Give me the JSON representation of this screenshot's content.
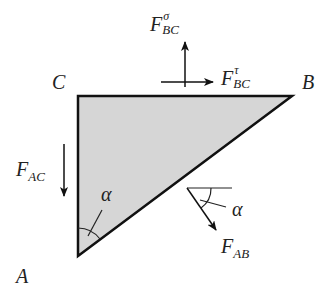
{
  "diagram": {
    "title_fragment": "",
    "vertices": {
      "A": "A",
      "B": "B",
      "C": "C"
    },
    "forces": {
      "F_BC_sigma": {
        "base": "F",
        "sup": "σ",
        "sub": "BC"
      },
      "F_BC_tau": {
        "base": "F",
        "sup": "τ",
        "sub": "BC"
      },
      "F_AC": {
        "base": "F",
        "sub": "AC"
      },
      "F_AB": {
        "base": "F",
        "sub": "AB"
      }
    },
    "angles": {
      "alpha_at_A": "α",
      "alpha_at_FAB": "α"
    },
    "colors": {
      "fill": "#d6d6d6",
      "stroke": "#111111"
    }
  }
}
